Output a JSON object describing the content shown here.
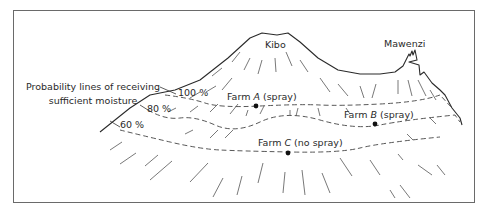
{
  "figure": {
    "title_lines": [
      "Probability lines of receiving",
      "sufficient moisture"
    ],
    "peaks": [
      {
        "name": "Kibo"
      },
      {
        "name": "Mawenzi"
      }
    ],
    "probability_lines": [
      {
        "label": "100 %",
        "value": 100
      },
      {
        "label": "80 %",
        "value": 80
      },
      {
        "label": "60 %",
        "value": 60
      }
    ],
    "farms": [
      {
        "prefix": "Farm ",
        "id": "A",
        "treatment": " (spray)"
      },
      {
        "prefix": "Farm ",
        "id": "B",
        "treatment": " (spray)"
      },
      {
        "prefix": "Farm ",
        "id": "C",
        "treatment": " (no spray)"
      }
    ]
  }
}
